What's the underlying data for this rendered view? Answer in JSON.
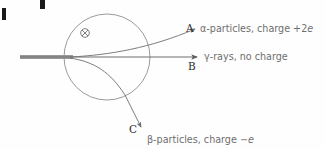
{
  "figure": {
    "kind": "physics-diagram",
    "background_color": "#fefefe"
  },
  "field_region": {
    "symbol": "⊗",
    "symbol_name": "field-into-page-symbol",
    "circle_color": "#8a8a8a",
    "center_x": 107,
    "center_y": 57,
    "radius": 43
  },
  "beam": {
    "name": "incident-radiation-beam",
    "color": "#9a9a9a",
    "start_x": 20,
    "end_x": 72,
    "y": 57,
    "thickness": 4
  },
  "paths": [
    {
      "id": "A",
      "label": "A",
      "description_prefix": "α-particles, charge +2",
      "description_italic": "e",
      "full_text": "α-particles, charge +2e",
      "stroke": "#767676",
      "label_x": 186,
      "label_y": 32,
      "text_x": 200,
      "text_y": 32
    },
    {
      "id": "B",
      "label": "B",
      "description_prefix": "γ-rays, no charge",
      "description_italic": "",
      "full_text": "γ-rays, no charge",
      "stroke": "#6e6e6e",
      "label_x": 188,
      "label_y": 70,
      "text_x": 204,
      "text_y": 60
    },
    {
      "id": "C",
      "label": "C",
      "description_prefix": "β-particles, charge −",
      "description_italic": "e",
      "full_text": "β-particles, charge −e",
      "stroke": "#767676",
      "label_x": 129,
      "label_y": 133,
      "text_x": 147,
      "text_y": 143
    }
  ],
  "cropped_heading_fragments": [
    {
      "name": "crop-fragment-left",
      "color": "#1a1a1a"
    },
    {
      "name": "crop-fragment-top",
      "color": "#1a1a1a"
    }
  ]
}
